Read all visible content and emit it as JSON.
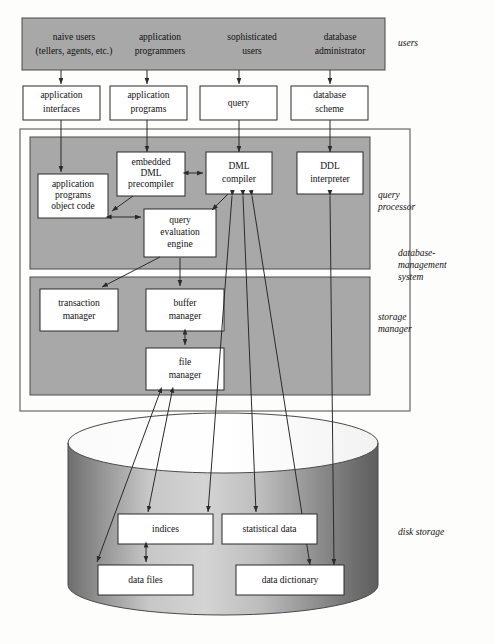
{
  "diagram": {
    "colors": {
      "panel_gray": "#a8a8a8",
      "box_fill": "#ffffff",
      "stroke": "#2b2b2b",
      "cylinder_dark": "#6f6f6f",
      "cylinder_light": "#d2d2d2",
      "background": "#fdfdfc"
    }
  },
  "users_banner": {
    "region_label": "users",
    "roles": [
      {
        "line1": "naive users",
        "line2": "(tellers, agents, etc.)"
      },
      {
        "line1": "application",
        "line2": "programmers"
      },
      {
        "line1": "sophisticated",
        "line2": "users"
      },
      {
        "line1": "database",
        "line2": "administrator"
      }
    ]
  },
  "interface_row": {
    "boxes": [
      {
        "line1": "application",
        "line2": "interfaces"
      },
      {
        "line1": "application",
        "line2": "programs"
      },
      {
        "line1": "query",
        "line2": ""
      },
      {
        "line1": "database",
        "line2": "scheme"
      }
    ]
  },
  "query_processor": {
    "region_label_line1": "query",
    "region_label_line2": "processor",
    "boxes": [
      {
        "line1": "application",
        "line2": "programs",
        "line3": "object code"
      },
      {
        "line1": "embedded",
        "line2": "DML",
        "line3": "precompiler"
      },
      {
        "line1": "DML",
        "line2": "compiler",
        "line3": ""
      },
      {
        "line1": "DDL",
        "line2": "interpreter",
        "line3": ""
      },
      {
        "line1": "query",
        "line2": "evaluation",
        "line3": "engine"
      }
    ]
  },
  "storage_manager": {
    "region_label_line1": "storage",
    "region_label_line2": "manager",
    "boxes": [
      {
        "line1": "transaction",
        "line2": "manager"
      },
      {
        "line1": "buffer",
        "line2": "manager"
      },
      {
        "line1": "file",
        "line2": "manager"
      }
    ]
  },
  "dbms": {
    "region_label_line1": "database-",
    "region_label_line2": "management",
    "region_label_line3": "system"
  },
  "disk_storage": {
    "region_label": "disk storage",
    "boxes": [
      {
        "label": "indices"
      },
      {
        "label": "statistical data"
      },
      {
        "label": "data files"
      },
      {
        "label": "data dictionary"
      }
    ]
  }
}
